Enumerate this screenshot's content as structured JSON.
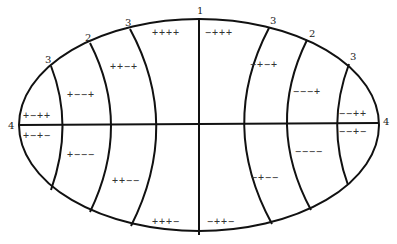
{
  "diagram": {
    "type": "elliptical region diagram with sign patterns",
    "boundary_labels": [
      {
        "id": "top-center",
        "text": "1",
        "x": 197,
        "y": 14
      },
      {
        "id": "top-left-inner",
        "text": "3",
        "x": 125,
        "y": 26
      },
      {
        "id": "top-left-middle",
        "text": "2",
        "x": 85,
        "y": 41
      },
      {
        "id": "top-left-outer",
        "text": "3",
        "x": 45,
        "y": 63
      },
      {
        "id": "left-end",
        "text": "4",
        "x": 8,
        "y": 129
      },
      {
        "id": "top-right-inner",
        "text": "3",
        "x": 270,
        "y": 24
      },
      {
        "id": "top-right-middle",
        "text": "2",
        "x": 309,
        "y": 37
      },
      {
        "id": "top-right-outer",
        "text": "3",
        "x": 350,
        "y": 60
      },
      {
        "id": "right-end",
        "text": "4",
        "x": 383,
        "y": 125
      }
    ],
    "regions": [
      {
        "id": "upper-left-outer",
        "signs": "+−++",
        "x": 23,
        "y": 119
      },
      {
        "id": "lower-left-outer",
        "signs": "+−+−",
        "x": 23,
        "y": 139
      },
      {
        "id": "upper-left-2",
        "signs": "+−−+",
        "x": 67,
        "y": 98
      },
      {
        "id": "lower-left-2",
        "signs": "+−−−",
        "x": 67,
        "y": 158
      },
      {
        "id": "upper-left-3",
        "signs": "++−+",
        "x": 110,
        "y": 70
      },
      {
        "id": "lower-left-3",
        "signs": "++−−",
        "x": 112,
        "y": 184
      },
      {
        "id": "upper-left-center",
        "signs": "++++",
        "x": 152,
        "y": 36
      },
      {
        "id": "lower-left-center",
        "signs": "+++−",
        "x": 152,
        "y": 225
      },
      {
        "id": "upper-right-center",
        "signs": "−+++",
        "x": 205,
        "y": 36
      },
      {
        "id": "lower-right-center",
        "signs": "−++−",
        "x": 207,
        "y": 225
      },
      {
        "id": "upper-right-3",
        "signs": "−+−+",
        "x": 250,
        "y": 68
      },
      {
        "id": "lower-right-3",
        "signs": "−+−−",
        "x": 251,
        "y": 181
      },
      {
        "id": "upper-right-2",
        "signs": "−−−+",
        "x": 293,
        "y": 95
      },
      {
        "id": "lower-right-2",
        "signs": "−−−−",
        "x": 295,
        "y": 155
      },
      {
        "id": "upper-right-outer",
        "signs": "−−++",
        "x": 339,
        "y": 117
      },
      {
        "id": "lower-right-outer",
        "signs": "−−+−",
        "x": 339,
        "y": 135
      }
    ]
  }
}
